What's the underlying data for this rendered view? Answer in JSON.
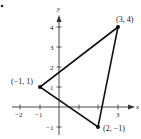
{
  "diagram": {
    "type": "coordinate-plane-triangle",
    "bullet": "•",
    "axes": {
      "x_label": "x",
      "y_label": "y",
      "x_ticks": [
        {
          "value": -2,
          "label": "−2"
        },
        {
          "value": -1,
          "label": "−1"
        },
        {
          "value": 1,
          "label": ""
        },
        {
          "value": 2,
          "label": ""
        },
        {
          "value": 3,
          "label": "3"
        }
      ],
      "y_ticks": [
        {
          "value": -1,
          "label": "−1"
        },
        {
          "value": 1,
          "label": "1"
        },
        {
          "value": 2,
          "label": "2"
        },
        {
          "value": 3,
          "label": "3"
        },
        {
          "value": 4,
          "label": "4"
        }
      ]
    },
    "vertices": [
      {
        "x": 3,
        "y": 4,
        "label": "(3, 4)"
      },
      {
        "x": -1,
        "y": 1,
        "label": "(−1, 1)"
      },
      {
        "x": 2,
        "y": -1,
        "label": "(2, −1)"
      }
    ],
    "colors": {
      "line": "#111111",
      "axis": "#333333",
      "text": "#222222"
    }
  }
}
